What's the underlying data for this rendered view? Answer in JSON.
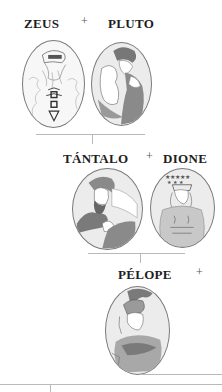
{
  "tree": {
    "generation_1": {
      "left": {
        "name": "ZEUS",
        "portrait": "zeus-portrait"
      },
      "connector": "+",
      "right": {
        "name": "PLUTO",
        "portrait": "pluto-portrait"
      }
    },
    "generation_2": {
      "left": {
        "name": "TÁNTALO",
        "portrait": "tantalo-portrait"
      },
      "connector": "+",
      "right": {
        "name": "DIONE",
        "portrait": "dione-portrait"
      }
    },
    "generation_3": {
      "left": {
        "name": "PÉLOPE",
        "portrait": "pelope-portrait"
      },
      "connector": "+"
    }
  },
  "colors": {
    "background": "#ffffff",
    "label": "#1e1e1e",
    "line": "#b9b9b9",
    "oval_fill": "#ececec",
    "oval_border": "#7a7a7a",
    "shade": "#8a8a8a"
  }
}
